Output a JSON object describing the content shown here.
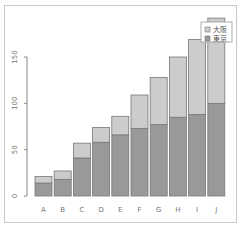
{
  "chart_data": {
    "type": "bar",
    "stacked": true,
    "title": "",
    "xlabel": "",
    "ylabel": "",
    "categories": [
      "A",
      "B",
      "C",
      "D",
      "E",
      "F",
      "G",
      "H",
      "I",
      "J"
    ],
    "series": [
      {
        "name": "東京",
        "color": "#999999",
        "values": [
          14,
          18,
          41,
          58,
          66,
          73,
          77,
          85,
          88,
          100
        ]
      },
      {
        "name": "大阪",
        "color": "#cccccc",
        "values": [
          7,
          9,
          16,
          16,
          20,
          36,
          51,
          65,
          81,
          92
        ]
      }
    ],
    "yticks": [
      0,
      50,
      100,
      150
    ],
    "ylim": [
      0,
      195
    ],
    "grid": false,
    "legend_position": "topright",
    "legend_entries": [
      "大阪",
      "東京"
    ]
  }
}
